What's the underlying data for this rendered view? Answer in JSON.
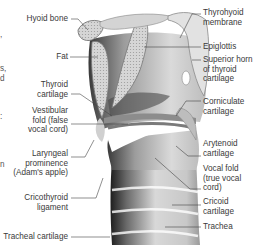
{
  "diagram": {
    "left_labels": [
      {
        "id": "hyoid-bone",
        "lines": [
          "Hyoid bone"
        ]
      },
      {
        "id": "fat",
        "lines": [
          "Fat"
        ]
      },
      {
        "id": "thyroid-cartilage",
        "lines": [
          "Thyroid",
          "cartilage"
        ]
      },
      {
        "id": "vestibular-fold",
        "lines": [
          "Vestibular",
          "fold (false",
          "vocal cord)"
        ]
      },
      {
        "id": "laryngeal-prominence",
        "lines": [
          "Laryngeal",
          "prominence",
          "(Adam's apple)"
        ]
      },
      {
        "id": "cricothyroid-ligament",
        "lines": [
          "Cricothyroid",
          "ligament"
        ]
      },
      {
        "id": "tracheal-cartilage",
        "lines": [
          "Tracheal cartilage"
        ]
      }
    ],
    "right_labels": [
      {
        "id": "thyrohyoid-membrane",
        "lines": [
          "Thyrohyoid",
          "membrane"
        ]
      },
      {
        "id": "epiglottis",
        "lines": [
          "Epiglottis"
        ]
      },
      {
        "id": "superior-horn",
        "lines": [
          "Superior horn",
          "of thyroid",
          "cartilage"
        ]
      },
      {
        "id": "corniculate-cartilage",
        "lines": [
          "Corniculate",
          "cartilage"
        ]
      },
      {
        "id": "arytenoid-cartilage",
        "lines": [
          "Arytenoid",
          "cartilage"
        ]
      },
      {
        "id": "vocal-fold",
        "lines": [
          "Vocal fold",
          "(true vocal",
          "cord)"
        ]
      },
      {
        "id": "cricoid-cartilage",
        "lines": [
          "Cricoid",
          "cartilage"
        ]
      },
      {
        "id": "trachea",
        "lines": [
          "Trachea"
        ]
      }
    ],
    "cropped_edge_text": [
      ",",
      "s,",
      "d",
      ":",
      "n"
    ],
    "colors": {
      "text": "#3a3a3a",
      "leader": "#444444",
      "tissue_light": "#e6e6e6",
      "tissue_mid": "#b5b5b5",
      "tissue_dark": "#2a2a2a"
    }
  }
}
